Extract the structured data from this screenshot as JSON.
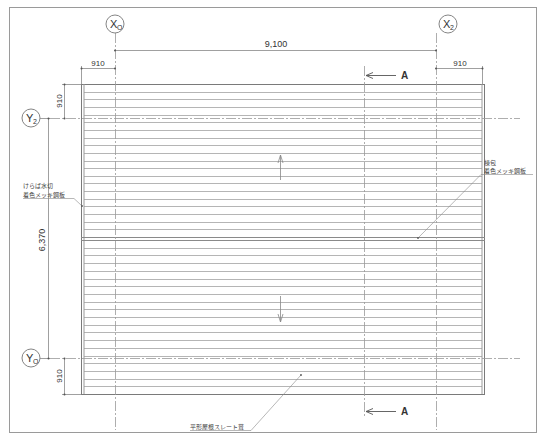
{
  "drawing": {
    "type": "roof-plan",
    "stroke_color": "#888888",
    "line_color_light": "#b5b5b5",
    "grid_axes": {
      "x": [
        {
          "id": "X0",
          "main": "X",
          "sub": "O"
        },
        {
          "id": "X2",
          "main": "X",
          "sub": "2"
        }
      ],
      "y": [
        {
          "id": "Y2",
          "main": "Y",
          "sub": "2"
        },
        {
          "id": "Y0",
          "main": "Y",
          "sub": "O"
        }
      ]
    },
    "dimensions": {
      "overall_x": "9,100",
      "overall_y": "6,370",
      "left_overhang": "910",
      "right_overhang": "910",
      "top_overhang": "910",
      "bottom_overhang": "910"
    },
    "section_marks": {
      "top": "A",
      "bottom": "A"
    },
    "notes": {
      "left_line1": "けらば水切",
      "left_line2": "着色メッキ鋼板",
      "right_line1": "棟包",
      "right_line2": "着色メッキ鋼板",
      "bottom": "平形屋根スレート葺"
    },
    "slate_rows_per_side": 20
  }
}
